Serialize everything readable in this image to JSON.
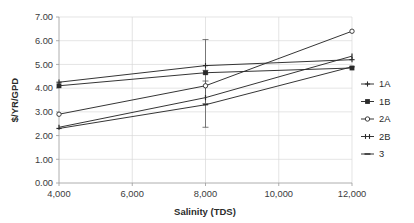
{
  "chart_data": {
    "type": "line",
    "title": "",
    "xlabel": "Salinity (TDS)",
    "ylabel": "$/YR/GPD",
    "x": [
      4000,
      8000,
      12000
    ],
    "xlim": [
      4000,
      12000
    ],
    "ylim": [
      0.0,
      7.0
    ],
    "xticks": [
      4000,
      6000,
      8000,
      10000,
      12000
    ],
    "xtick_labels": [
      "4,000",
      "6,000",
      "8,000",
      "10,000",
      "12,000"
    ],
    "yticks": [
      0.0,
      1.0,
      2.0,
      3.0,
      4.0,
      5.0,
      6.0,
      7.0
    ],
    "ytick_labels": [
      "0.00",
      "1.00",
      "2.00",
      "3.00",
      "4.00",
      "5.00",
      "6.00",
      "7.00"
    ],
    "grid": "horizontal-and-vertical",
    "legend_position": "right",
    "series": [
      {
        "name": "1A",
        "values": [
          4.25,
          4.95,
          5.2
        ],
        "marker": "small-cross",
        "color": "#2a2a2a"
      },
      {
        "name": "1B",
        "values": [
          4.1,
          4.65,
          4.85
        ],
        "marker": "filled-square",
        "color": "#2a2a2a"
      },
      {
        "name": "2A",
        "values": [
          2.9,
          4.1,
          6.4
        ],
        "marker": "open-circle",
        "color": "#2a2a2a"
      },
      {
        "name": "2B",
        "values": [
          2.35,
          3.6,
          5.35
        ],
        "marker": "tick-bar",
        "color": "#2a2a2a"
      },
      {
        "name": "3",
        "values": [
          2.3,
          3.3,
          4.9
        ],
        "marker": "dash",
        "color": "#2a2a2a"
      }
    ],
    "error_bars": [
      {
        "x": 8000,
        "series": "1A",
        "center": 4.95,
        "low": 4.6,
        "high": 6.05
      },
      {
        "x": 8000,
        "series": "2A",
        "center": 4.1,
        "low": 3.35,
        "high": 4.75
      },
      {
        "x": 8000,
        "series": "2B",
        "center": 3.6,
        "low": 2.35,
        "high": 4.3
      }
    ],
    "annotations": []
  },
  "legend": {
    "entries": [
      {
        "label": "1A"
      },
      {
        "label": "1B"
      },
      {
        "label": "2A"
      },
      {
        "label": "2B"
      },
      {
        "label": "3"
      }
    ]
  },
  "axes": {
    "x_title": "Salinity (TDS)",
    "y_title": "$/YR/GPD"
  }
}
